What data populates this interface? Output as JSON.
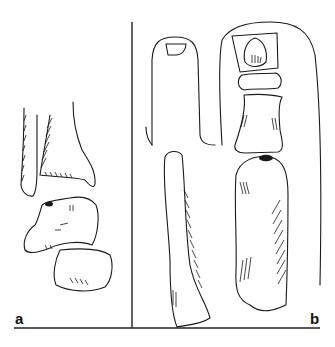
{
  "figure": {
    "panels": [
      {
        "id": "a",
        "label": "a",
        "content": "distal tibia and fibula with talus and calcaneus"
      },
      {
        "id": "b",
        "label": "b",
        "content": "toes with phalanges and metatarsals"
      }
    ],
    "colors": {
      "line": "#1a1a1a",
      "background": "#ffffff"
    }
  }
}
